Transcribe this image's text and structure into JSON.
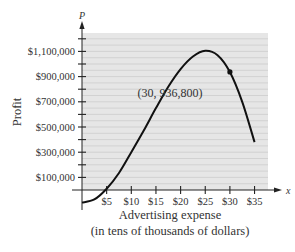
{
  "chart_data": {
    "type": "line",
    "title": "",
    "xlabel": "Advertising expense",
    "xlabel_sub": "(in tens of thousands of dollars)",
    "ylabel": "Profit",
    "x_var": "x",
    "y_var": "P",
    "x_ticks": [
      "$5",
      "$10",
      "$15",
      "$20",
      "$25",
      "$30",
      "$35"
    ],
    "x_tick_values": [
      5,
      10,
      15,
      20,
      25,
      30,
      35
    ],
    "y_ticks": [
      "$1,100,000",
      "$900,000",
      "$700,000",
      "$500,000",
      "$300,000",
      "$100,000"
    ],
    "y_tick_values": [
      1100000,
      900000,
      700000,
      500000,
      300000,
      100000
    ],
    "xlim": [
      0,
      37
    ],
    "ylim": [
      -100000,
      1250000
    ],
    "grid": true,
    "legend": null,
    "series": [
      {
        "name": "Profit",
        "x": [
          0,
          2.5,
          5,
          7.5,
          10,
          12.5,
          15,
          17.5,
          20,
          22.5,
          25,
          27.5,
          30,
          32.5,
          35
        ],
        "values": [
          -100000,
          -75000,
          10000,
          135000,
          300000,
          470000,
          650000,
          820000,
          960000,
          1060000,
          1105000,
          1070000,
          936800,
          700000,
          380000
        ]
      }
    ],
    "annotations": [
      {
        "text": "(30, 936,800)",
        "x": 30,
        "y": 936800,
        "marker": true
      }
    ]
  }
}
